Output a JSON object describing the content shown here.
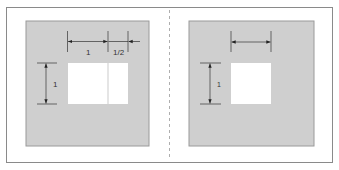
{
  "diagram": {
    "colors": {
      "frame": "#8a8a8a",
      "panel_fill": "#cfcfcf",
      "panel_border": "#9a9a9a",
      "opening_fill": "#ffffff",
      "dimension_line": "#333333",
      "divider": "#9a9a9a"
    },
    "left_panel": {
      "width_labels": [
        "1",
        "1/2"
      ],
      "height_label": "1"
    },
    "right_panel": {
      "height_label": "1"
    }
  }
}
